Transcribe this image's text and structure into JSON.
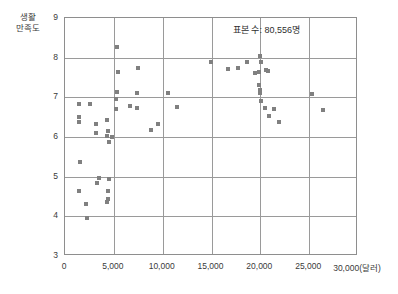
{
  "chart_data": {
    "type": "scatter",
    "title": "",
    "xlabel": "30,000(달러)",
    "ylabel": "생활\n만족도",
    "annotation": "표본 수: 80,556명",
    "xlim": [
      0,
      30000
    ],
    "ylim": [
      3,
      9
    ],
    "grid": true,
    "legend": "none",
    "marker_color": "#808080",
    "axis_color": "#8e8e8e",
    "grid_color": "#9a9a9a",
    "xticks": [
      {
        "value": 0,
        "label": "0"
      },
      {
        "value": 5000,
        "label": "5,000"
      },
      {
        "value": 10000,
        "label": "10,000"
      },
      {
        "value": 15000,
        "label": "15,000"
      },
      {
        "value": 20000,
        "label": "20,000"
      },
      {
        "value": 25000,
        "label": "25,000"
      },
      {
        "value": 30000,
        "label": "30,000(달러)"
      }
    ],
    "yticks": [
      {
        "value": 3,
        "label": "3"
      },
      {
        "value": 4,
        "label": "4"
      },
      {
        "value": 5,
        "label": "5"
      },
      {
        "value": 6,
        "label": "6"
      },
      {
        "value": 7,
        "label": "7"
      },
      {
        "value": 8,
        "label": "8"
      },
      {
        "value": 9,
        "label": "9"
      }
    ],
    "points": [
      [
        1450,
        6.82
      ],
      [
        1400,
        6.5
      ],
      [
        1400,
        6.38
      ],
      [
        2550,
        6.82
      ],
      [
        3150,
        6.33
      ],
      [
        3200,
        6.1
      ],
      [
        4350,
        6.42
      ],
      [
        4400,
        6.15
      ],
      [
        4250,
        6.02
      ],
      [
        4800,
        6.0
      ],
      [
        4550,
        5.88
      ],
      [
        1500,
        5.37
      ],
      [
        3500,
        4.97
      ],
      [
        4500,
        4.95
      ],
      [
        1400,
        4.64
      ],
      [
        3300,
        4.85
      ],
      [
        4450,
        4.65
      ],
      [
        4350,
        4.35
      ],
      [
        4400,
        4.43
      ],
      [
        2200,
        4.3
      ],
      [
        2300,
        3.95
      ],
      [
        5350,
        8.27
      ],
      [
        5400,
        7.65
      ],
      [
        7500,
        7.75
      ],
      [
        5300,
        7.13
      ],
      [
        7400,
        7.1
      ],
      [
        5250,
        6.97
      ],
      [
        5200,
        6.7
      ],
      [
        6700,
        6.77
      ],
      [
        7350,
        6.73
      ],
      [
        9500,
        6.33
      ],
      [
        10500,
        7.12
      ],
      [
        11500,
        6.75
      ],
      [
        8800,
        6.18
      ],
      [
        14900,
        7.88
      ],
      [
        16700,
        7.72
      ],
      [
        17700,
        7.75
      ],
      [
        18600,
        7.88
      ],
      [
        19500,
        7.62
      ],
      [
        19900,
        7.65
      ],
      [
        20000,
        8.05
      ],
      [
        20100,
        7.88
      ],
      [
        20600,
        7.68
      ],
      [
        20800,
        7.66
      ],
      [
        19900,
        7.3
      ],
      [
        19950,
        7.18
      ],
      [
        20000,
        7.12
      ],
      [
        20100,
        6.9
      ],
      [
        20500,
        6.72
      ],
      [
        21400,
        6.7
      ],
      [
        20900,
        6.52
      ],
      [
        21900,
        6.37
      ],
      [
        25300,
        7.08
      ],
      [
        26400,
        6.68
      ]
    ]
  }
}
